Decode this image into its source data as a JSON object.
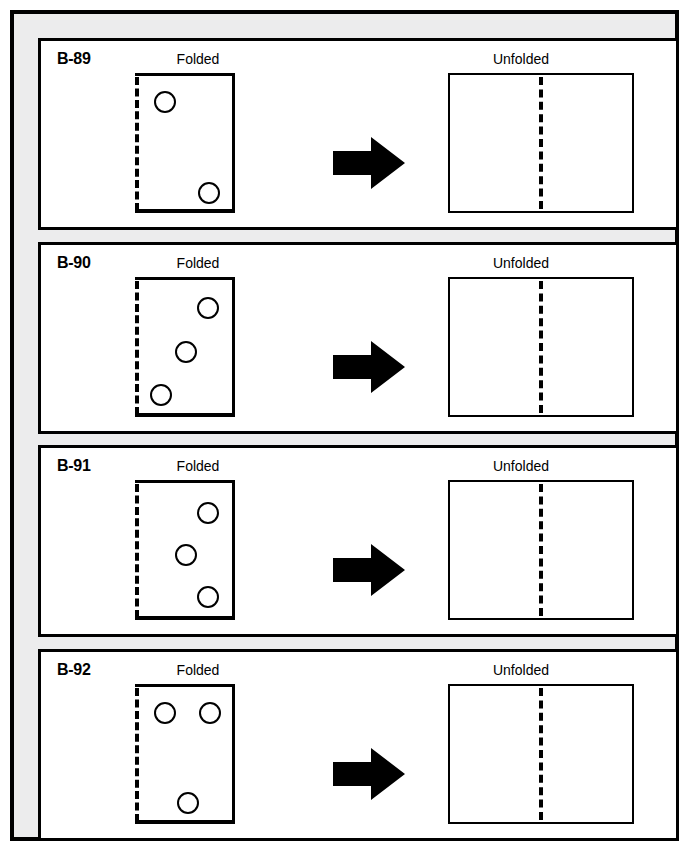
{
  "page": {
    "frame_color": "#000000",
    "gutter_color": "#ececed",
    "panel_background": "#ffffff",
    "ink_color": "#000000"
  },
  "labels": {
    "folded": "Folded",
    "unfolded": "Unfolded",
    "arrow": "right-arrow"
  },
  "panels": [
    {
      "code": "B-89",
      "folded_caption": "Folded",
      "unfolded_caption": "Unfolded",
      "holes": [
        {
          "x": 19,
          "y": 18
        },
        {
          "x": 63,
          "y": 109
        }
      ],
      "unfolded_holes": []
    },
    {
      "code": "B-90",
      "folded_caption": "Folded",
      "unfolded_caption": "Unfolded",
      "holes": [
        {
          "x": 62,
          "y": 20
        },
        {
          "x": 40,
          "y": 64
        },
        {
          "x": 15,
          "y": 107
        }
      ],
      "unfolded_holes": []
    },
    {
      "code": "B-91",
      "folded_caption": "Folded",
      "unfolded_caption": "Unfolded",
      "holes": [
        {
          "x": 62,
          "y": 22
        },
        {
          "x": 40,
          "y": 64
        },
        {
          "x": 62,
          "y": 106
        }
      ],
      "unfolded_holes": []
    },
    {
      "code": "B-92",
      "folded_caption": "Folded",
      "unfolded_caption": "Unfolded",
      "holes": [
        {
          "x": 19,
          "y": 18
        },
        {
          "x": 64,
          "y": 18
        },
        {
          "x": 42,
          "y": 108
        }
      ],
      "unfolded_holes": []
    }
  ]
}
